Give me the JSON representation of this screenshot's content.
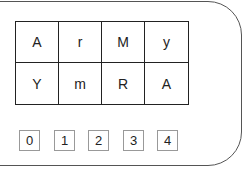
{
  "grid": {
    "rows": [
      [
        "A",
        "r",
        "M",
        "y"
      ],
      [
        "Y",
        "m",
        "R",
        "A"
      ]
    ]
  },
  "number_boxes": [
    "0",
    "1",
    "2",
    "3",
    "4"
  ]
}
